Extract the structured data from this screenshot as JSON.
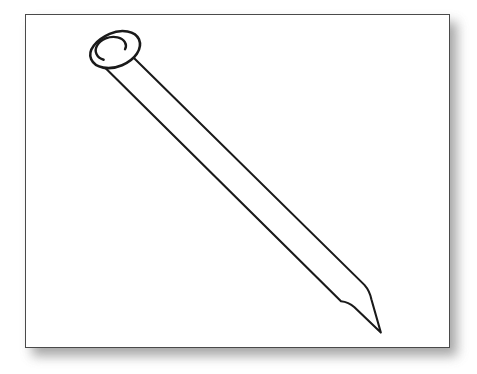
{
  "image": {
    "subject": "nail",
    "style": "black-and-white line drawing",
    "background_color": "#ffffff",
    "frame": {
      "border_color": "#4a4a4a",
      "fill_color": "#ffffff",
      "shadow_color": "#8d8d8d",
      "x": 25,
      "y": 14,
      "width": 425,
      "height": 334
    },
    "drawing": {
      "stroke_color": "#1a1a1a",
      "fill_color": "#ffffff",
      "orientation": "head at upper-left, point at lower-right",
      "parts": [
        {
          "name": "nail-head",
          "description": "flat circular head seen at an angle as a tilted ellipse"
        },
        {
          "name": "nail-shaft",
          "description": "long straight tapering shank running diagonally down-right"
        },
        {
          "name": "nail-point",
          "description": "sharp tapered tip at the lower-right end"
        }
      ]
    },
    "caption": ""
  }
}
